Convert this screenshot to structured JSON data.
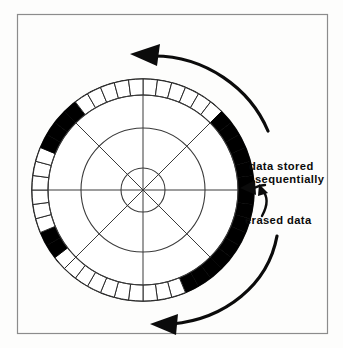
{
  "figure": {
    "frame": {
      "border_color": "#8c8c8c",
      "background_color": "#fdfdfc",
      "x": 17,
      "y": 14,
      "width": 311,
      "height": 320
    },
    "disk": {
      "center_x": 143,
      "center_y": 190,
      "outer_radius": 111,
      "ring_inner_radius": 95,
      "track_radii": [
        22,
        62,
        95
      ],
      "spoke_count": 8,
      "ring_sector_count": 48,
      "line_color": "#3a3a3a",
      "fill_color": "#ffffff",
      "data_color": "#000000"
    },
    "legend": {
      "data_stored_color": "#000000",
      "erased_color": "#000000"
    },
    "labels": [
      {
        "id": "data-stored-label",
        "line1": "data stored",
        "line2": "sequentially",
        "x": 249,
        "y": 166
      },
      {
        "id": "erased-data-label",
        "line1": "erased data",
        "line2": "",
        "x": 249,
        "y": 222
      }
    ],
    "arrows": [
      {
        "id": "rotation-arrow-top",
        "direction": "counterclockwise",
        "position": "top"
      },
      {
        "id": "rotation-arrow-bottom",
        "direction": "counterclockwise",
        "position": "bottom"
      },
      {
        "id": "data-stored-pointer",
        "direction": "left",
        "position": "right-middle"
      },
      {
        "id": "erased-data-pointer",
        "direction": "up-left",
        "position": "right-lower"
      }
    ]
  },
  "chart_data": {
    "type": "pie",
    "xlabel": "",
    "ylabel": "",
    "legend_position": "right",
    "categories": [
      "data stored sequentially",
      "erased data",
      "free space"
    ],
    "annotations": [
      "data stored sequentially",
      "erased data"
    ],
    "ring_sectors_total": 48,
    "ring_sector_states": [
      "empty",
      "empty",
      "empty",
      "empty",
      "empty",
      "empty",
      "filled",
      "filled",
      "filled",
      "filled",
      "filled",
      "filled",
      "filled",
      "filled",
      "filled",
      "filled",
      "filled",
      "filled",
      "filled",
      "filled",
      "filled",
      "empty",
      "empty",
      "empty",
      "empty",
      "empty",
      "empty",
      "empty",
      "empty",
      "empty",
      "empty",
      "filled",
      "filled",
      "empty",
      "empty",
      "empty",
      "empty",
      "empty",
      "empty",
      "filled",
      "filled",
      "filled",
      "filled",
      "empty",
      "empty",
      "empty",
      "empty",
      "empty"
    ],
    "values": [
      21,
      6,
      21
    ]
  }
}
